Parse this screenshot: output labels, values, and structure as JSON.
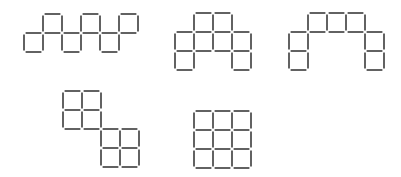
{
  "diagram": {
    "stroke_color": "#2e2e2e",
    "unit": 19,
    "figures": [
      {
        "name": "figure-1-zigzag",
        "origin": [
          24,
          14
        ],
        "cells": [
          [
            0,
            1
          ],
          [
            1,
            0
          ],
          [
            2,
            1
          ],
          [
            3,
            0
          ],
          [
            4,
            1
          ],
          [
            5,
            0
          ]
        ]
      },
      {
        "name": "figure-2-arch-block",
        "origin": [
          175,
          13
        ],
        "cells": [
          [
            1,
            0
          ],
          [
            2,
            0
          ],
          [
            0,
            1
          ],
          [
            1,
            1
          ],
          [
            2,
            1
          ],
          [
            3,
            1
          ],
          [
            0,
            2
          ],
          [
            3,
            2
          ]
        ]
      },
      {
        "name": "figure-3-arch",
        "origin": [
          289,
          13
        ],
        "cells": [
          [
            1,
            0
          ],
          [
            2,
            0
          ],
          [
            3,
            0
          ],
          [
            0,
            1
          ],
          [
            0,
            2
          ],
          [
            4,
            1
          ],
          [
            4,
            2
          ]
        ]
      },
      {
        "name": "figure-4-staggered-blocks",
        "origin": [
          63,
          91
        ],
        "cells": [
          [
            0,
            0
          ],
          [
            1,
            0
          ],
          [
            0,
            1
          ],
          [
            1,
            1
          ],
          [
            2,
            2
          ],
          [
            3,
            2
          ],
          [
            2,
            3
          ],
          [
            3,
            3
          ]
        ]
      },
      {
        "name": "figure-5-3x3-grid",
        "origin": [
          194,
          111
        ],
        "cells": [
          [
            0,
            0
          ],
          [
            1,
            0
          ],
          [
            2,
            0
          ],
          [
            0,
            1
          ],
          [
            1,
            1
          ],
          [
            2,
            1
          ],
          [
            0,
            2
          ],
          [
            1,
            2
          ],
          [
            2,
            2
          ]
        ]
      }
    ]
  }
}
